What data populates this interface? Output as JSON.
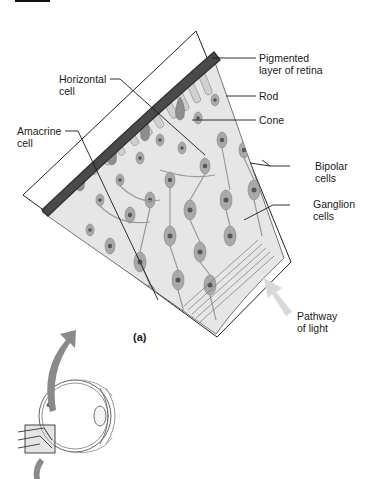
{
  "figure": {
    "panel_label": "(a)",
    "labels": {
      "pigmented": {
        "line1": "Pigmented",
        "line2": "layer of retina"
      },
      "rod": {
        "line1": "Rod"
      },
      "cone": {
        "line1": "Cone"
      },
      "bipolar": {
        "line1": "Bipolar",
        "line2": "cells"
      },
      "ganglion": {
        "line1": "Ganglion",
        "line2": "cells"
      },
      "horizontal": {
        "line1": "Horizontal",
        "line2": "cell"
      },
      "amacrine": {
        "line1": "Amacrine",
        "line2": "cell"
      },
      "pathway": {
        "line1": "Pathway",
        "line2": "of light"
      }
    },
    "colors": {
      "pigment": "#4a4a4a",
      "tissue": "#e4e4e4",
      "cell_fill": "#a8a8a8",
      "nucleus": "#5a5a5a",
      "arrow": "#8a8a8a",
      "light_arrow": "#d6d6d6",
      "leader": "#1a1a1a"
    }
  }
}
